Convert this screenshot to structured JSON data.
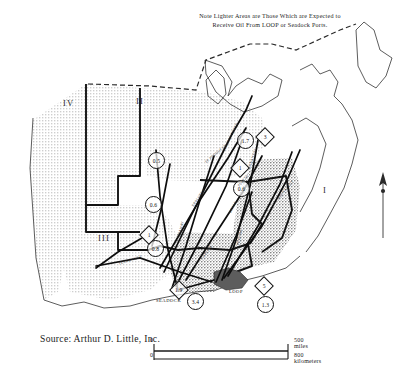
{
  "note": {
    "line1": "Note Lighter Areas are Those Which are Expected to",
    "line2": "Receive Oil From LOOP or Seadock Ports."
  },
  "source": {
    "text": "Source: Arthur D. Little, Inc."
  },
  "scale": {
    "zero_top": "0",
    "zero_bottom": "0",
    "miles": "500 miles",
    "kilometers": "800 kilometers"
  },
  "regions": [
    {
      "label": "IV",
      "x": 63,
      "y": 98
    },
    {
      "label": "II",
      "x": 136,
      "y": 96
    },
    {
      "label": "III",
      "x": 98,
      "y": 233
    },
    {
      "label": "I",
      "x": 323,
      "y": 185
    }
  ],
  "ports": [
    {
      "name": "SEADOCK",
      "x": 156,
      "y": 298
    },
    {
      "name": "LOOP",
      "x": 229,
      "y": 289
    }
  ],
  "flow_markers": [
    {
      "shape": "circle",
      "value": "0.5",
      "x": 148,
      "y": 152
    },
    {
      "shape": "circle",
      "value": "0.6",
      "x": 145,
      "y": 196
    },
    {
      "shape": "circle",
      "value": "0.8",
      "x": 147,
      "y": 240
    },
    {
      "shape": "diamond",
      "value": "1",
      "x": 142,
      "y": 228
    },
    {
      "shape": "circle",
      "value": "1.7",
      "x": 237,
      "y": 132
    },
    {
      "shape": "diamond",
      "value": "3",
      "x": 258,
      "y": 130
    },
    {
      "shape": "diamond",
      "value": "1",
      "x": 233,
      "y": 161
    },
    {
      "shape": "circle",
      "value": "0.6",
      "x": 233,
      "y": 180
    },
    {
      "shape": "circle",
      "value": "3.4",
      "x": 187,
      "y": 293
    },
    {
      "shape": "diamond",
      "value": "1.9",
      "x": 172,
      "y": 283
    },
    {
      "shape": "diamond",
      "value": "5",
      "x": 257,
      "y": 279
    },
    {
      "shape": "circle",
      "value": "1.3",
      "x": 257,
      "y": 296
    }
  ],
  "pipelines": [
    {
      "name": "CAPLINE",
      "x": 200,
      "y": 258,
      "rot": -54
    },
    {
      "name": "TEXOMA",
      "x": 236,
      "y": 245,
      "rot": -78
    },
    {
      "name": "SEAWAY",
      "x": 177,
      "y": 236,
      "rot": -76
    },
    {
      "name": "TEXAS GULF",
      "x": 118,
      "y": 262,
      "rot": -18
    },
    {
      "name": "EXPLORER",
      "x": 191,
      "y": 205,
      "rot": -55
    },
    {
      "name": "OZARK",
      "x": 228,
      "y": 212,
      "rot": -61
    },
    {
      "name": "PLATTE",
      "x": 237,
      "y": 185,
      "rot": -52
    },
    {
      "name": "MID VALLEY",
      "x": 276,
      "y": 198,
      "rot": -50
    },
    {
      "name": "TEXOMA NORTH",
      "x": 222,
      "y": 150,
      "rot": -64
    },
    {
      "name": "ARKANSAS",
      "x": 247,
      "y": 168,
      "rot": -71
    },
    {
      "name": "TE PRODUCTS",
      "x": 204,
      "y": 161,
      "rot": -40
    }
  ],
  "colors": {
    "stipple": "#9a9a9a",
    "outline": "#141414",
    "water": "#6f6f6f",
    "ink": "#1a1a1a"
  }
}
